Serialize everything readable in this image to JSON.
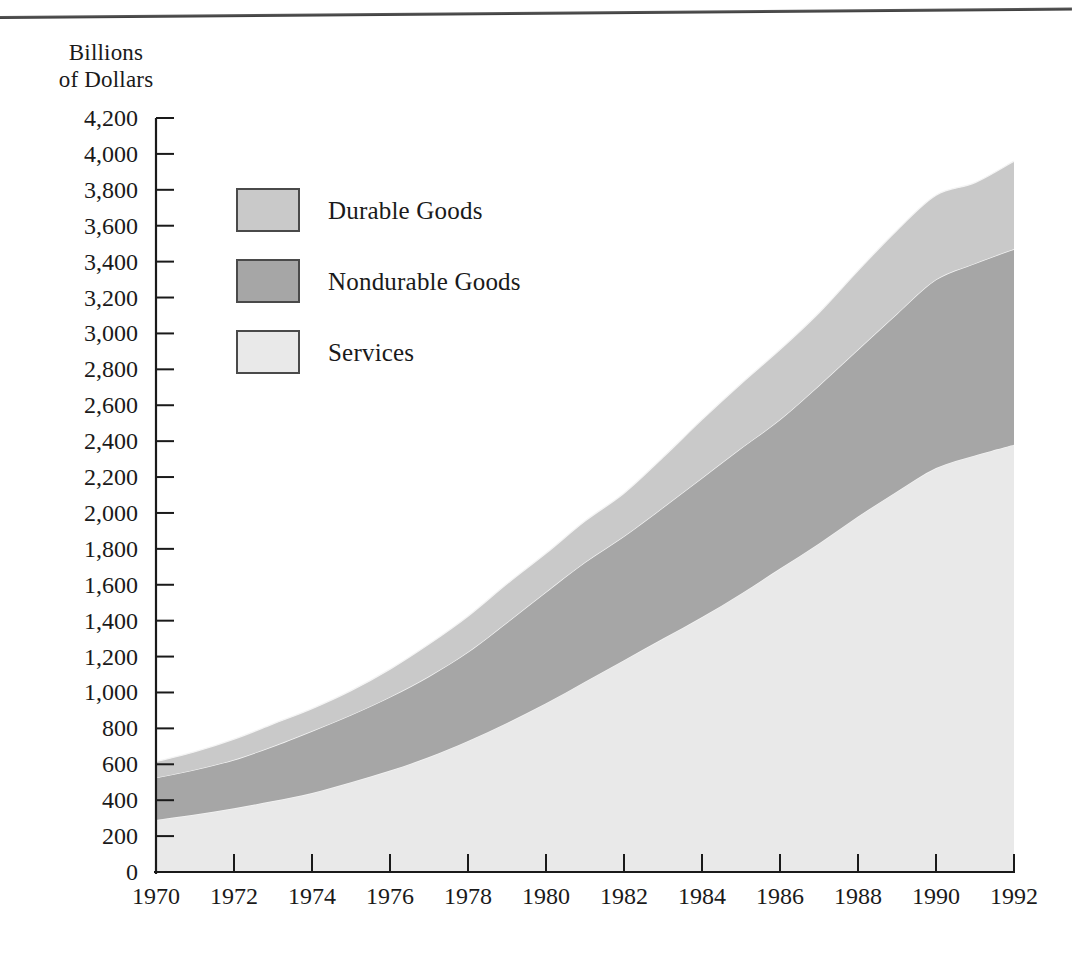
{
  "chart_data": {
    "type": "area",
    "stacked": true,
    "title": "",
    "xlabel": "",
    "ylabel": "Billions of Dollars",
    "ylabel_lines": [
      "Billions",
      "of Dollars"
    ],
    "ylim": [
      0,
      4200
    ],
    "ytick_step": 200,
    "yticks": [
      4200,
      4000,
      3800,
      3600,
      3400,
      3200,
      3000,
      2800,
      2600,
      2400,
      2200,
      2000,
      1800,
      1600,
      1400,
      1200,
      1000,
      800,
      600,
      400,
      200,
      0
    ],
    "ytick_labels": [
      "4,200",
      "4,000",
      "3,800",
      "3,600",
      "3,400",
      "3,200",
      "3,000",
      "2,800",
      "2,600",
      "2,400",
      "2,200",
      "2,000",
      "1,800",
      "1,600",
      "1,400",
      "1,200",
      "1,000",
      "800",
      "600",
      "400",
      "200",
      "0"
    ],
    "xlim": [
      1970,
      1992
    ],
    "xtick_step": 2,
    "xticks": [
      1970,
      1972,
      1974,
      1976,
      1978,
      1980,
      1982,
      1984,
      1986,
      1988,
      1990,
      1992
    ],
    "xtick_labels": [
      "1970",
      "1972",
      "1974",
      "1976",
      "1978",
      "1980",
      "1982",
      "1984",
      "1986",
      "1988",
      "1990",
      "1992"
    ],
    "x": [
      1970,
      1971,
      1972,
      1973,
      1974,
      1975,
      1976,
      1977,
      1978,
      1979,
      1980,
      1981,
      1982,
      1983,
      1984,
      1985,
      1986,
      1987,
      1988,
      1989,
      1990,
      1991,
      1992
    ],
    "grid": false,
    "legend_position": "upper-left-inside",
    "series": [
      {
        "name": "Services",
        "color": "#e9e9e9",
        "stack_order": 1,
        "values": [
          290,
          320,
          355,
          395,
          440,
          500,
          565,
          640,
          730,
          830,
          940,
          1060,
          1180,
          1300,
          1420,
          1550,
          1690,
          1830,
          1980,
          2120,
          2250,
          2320,
          2380
        ]
      },
      {
        "name": "Nondurable Goods",
        "color": "#a6a6a6",
        "stack_order": 2,
        "values": [
          235,
          250,
          270,
          305,
          345,
          375,
          410,
          450,
          495,
          560,
          620,
          665,
          690,
          730,
          775,
          810,
          830,
          880,
          930,
          990,
          1050,
          1070,
          1090
        ]
      },
      {
        "name": "Durable Goods",
        "color": "#c9c9c9",
        "stack_order": 3,
        "values": [
          90,
          100,
          115,
          125,
          125,
          135,
          155,
          180,
          200,
          215,
          215,
          230,
          240,
          280,
          325,
          360,
          390,
          405,
          440,
          465,
          470,
          450,
          490
        ]
      }
    ],
    "cumulative_top": [
      615,
      670,
      740,
      825,
      910,
      1010,
      1130,
      1270,
      1425,
      1605,
      1775,
      1955,
      2110,
      2310,
      2520,
      2720,
      2910,
      3115,
      3350,
      3575,
      3770,
      3840,
      3960
    ]
  },
  "legend": {
    "items": [
      {
        "label": "Durable Goods",
        "color": "#c9c9c9"
      },
      {
        "label": "Nondurable Goods",
        "color": "#a6a6a6"
      },
      {
        "label": "Services",
        "color": "#e9e9e9"
      }
    ]
  },
  "axis": {
    "y_title_line1": "Billions",
    "y_title_line2": "of Dollars"
  },
  "colors": {
    "axis_line": "#1a1a1a",
    "durable": "#c9c9c9",
    "nondurable": "#a6a6a6",
    "services": "#e9e9e9",
    "background": "#ffffff",
    "rule": "#4a4a4a"
  }
}
